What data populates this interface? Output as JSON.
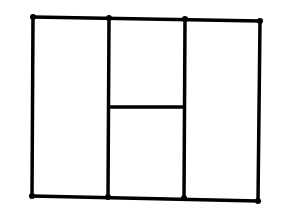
{
  "diagram": {
    "type": "line-drawing",
    "stroke_color": "#000000",
    "background_color": "#ffffff",
    "stroke_width": 3.5,
    "points": {
      "tl": [
        33,
        17
      ],
      "t1": [
        109,
        18
      ],
      "t2": [
        185,
        19
      ],
      "tr": [
        260,
        21
      ],
      "bl": [
        32,
        196
      ],
      "b1": [
        108,
        197
      ],
      "b2": [
        184,
        198
      ],
      "br": [
        258,
        201
      ],
      "m1": [
        109,
        107
      ],
      "m2": [
        184,
        107
      ]
    },
    "segments": [
      {
        "name": "top-edge",
        "from": "tl",
        "to": "tr"
      },
      {
        "name": "bottom-edge",
        "from": "bl",
        "to": "br"
      },
      {
        "name": "left-edge",
        "from": "tl",
        "to": "bl"
      },
      {
        "name": "right-edge",
        "from": "tr",
        "to": "br"
      },
      {
        "name": "divider-left",
        "from": "t1",
        "to": "b1"
      },
      {
        "name": "divider-right",
        "from": "t2",
        "to": "b2"
      },
      {
        "name": "middle-horizontal",
        "from": "m1",
        "to": "m2"
      }
    ],
    "dots": [
      "tl",
      "t1",
      "t2",
      "tr",
      "bl",
      "b1",
      "b2",
      "br"
    ]
  }
}
